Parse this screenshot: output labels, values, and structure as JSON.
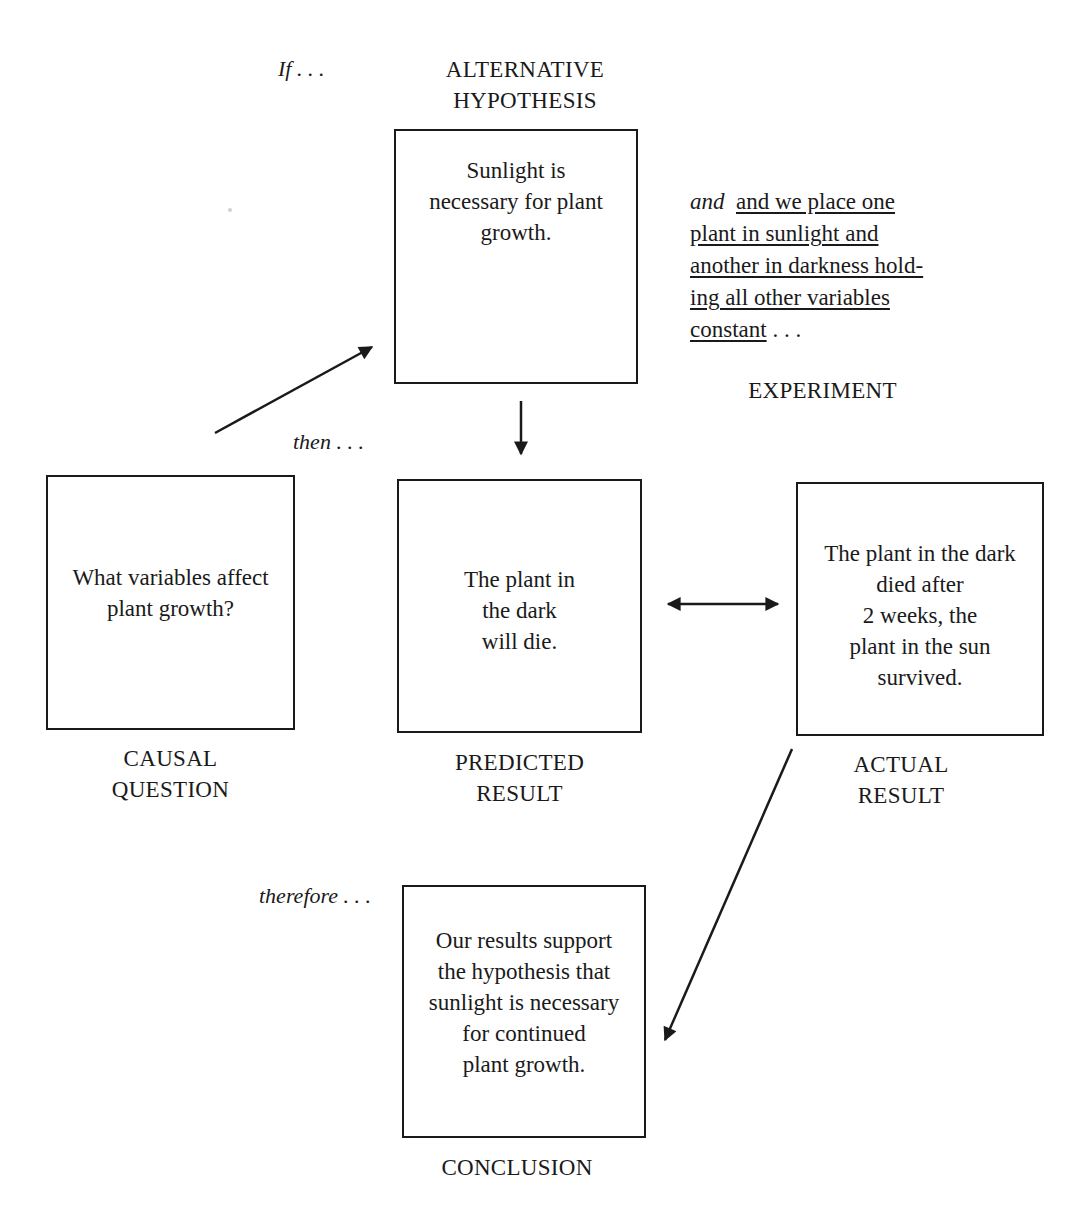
{
  "diagram": {
    "connectors": {
      "if": "If . . .",
      "then": "then . . .",
      "therefore": "therefore . . .",
      "and": "and"
    },
    "nodes": {
      "hypothesis": {
        "caption_lines": [
          "ALTERNATIVE",
          "HYPOTHESIS"
        ],
        "text_lines": [
          "Sunlight is",
          "necessary for plant",
          "growth."
        ]
      },
      "experiment": {
        "caption": "EXPERIMENT",
        "text_lines": [
          "and we place one",
          "plant in  sunlight and",
          "another in darkness hold-",
          "ing all other variables",
          "constant"
        ],
        "trailing": ". . ."
      },
      "causal_question": {
        "caption_lines": [
          "CAUSAL",
          "QUESTION"
        ],
        "text_lines": [
          "What variables affect",
          "plant growth?"
        ]
      },
      "predicted_result": {
        "caption_lines": [
          "PREDICTED",
          "RESULT"
        ],
        "text_lines": [
          "The plant in",
          "the dark",
          "will die."
        ]
      },
      "actual_result": {
        "caption_lines": [
          "ACTUAL",
          "RESULT"
        ],
        "text_lines": [
          "The plant in the dark",
          "died after",
          "2 weeks, the",
          "plant in the sun",
          "survived."
        ]
      },
      "conclusion": {
        "caption": "CONCLUSION",
        "text_lines": [
          "Our results support",
          "the hypothesis that",
          "sunlight is necessary",
          "for continued",
          "plant growth."
        ]
      }
    },
    "edges": [
      {
        "from": "causal_question",
        "to": "hypothesis",
        "type": "arrow"
      },
      {
        "from": "hypothesis",
        "to": "predicted_result",
        "type": "arrow"
      },
      {
        "from": "predicted_result",
        "to": "actual_result",
        "type": "double-arrow"
      },
      {
        "from": "actual_result",
        "to": "conclusion",
        "type": "arrow"
      }
    ],
    "colors": {
      "ink": "#1a1a1a",
      "background": "#ffffff"
    }
  }
}
